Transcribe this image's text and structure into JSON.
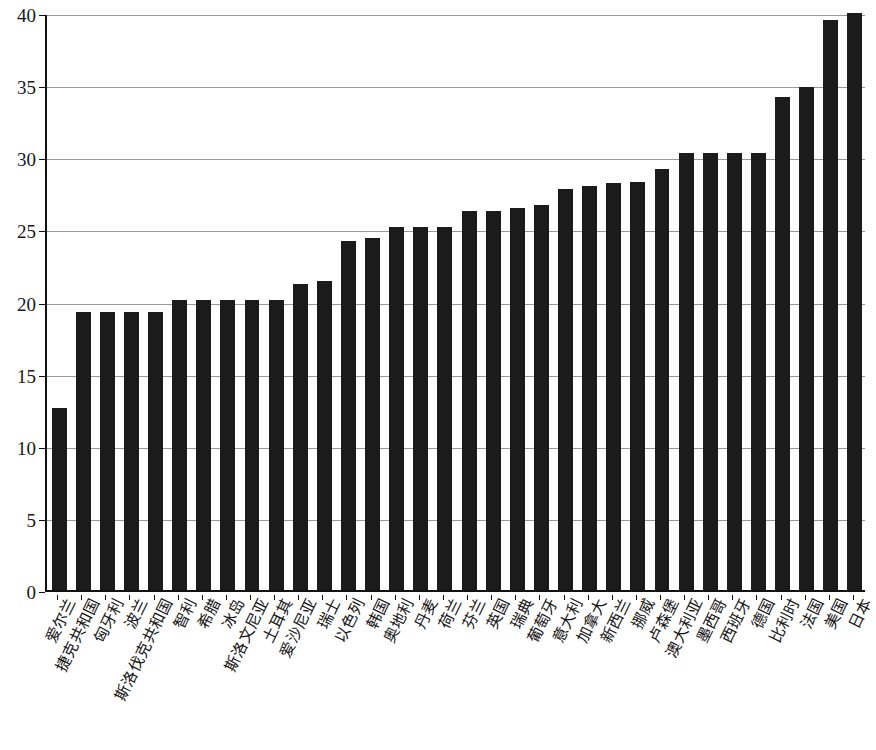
{
  "chart_data": {
    "type": "bar",
    "title": "",
    "subtitle": "",
    "xlabel": "",
    "ylabel": "",
    "ylim": [
      0,
      40
    ],
    "yticks": [
      0,
      5,
      10,
      15,
      20,
      25,
      30,
      35,
      40
    ],
    "grid": true,
    "legend": null,
    "bar_color": "#1b1b1b",
    "axis_color": "#111111",
    "grid_color": "#9a9a9a",
    "categories": [
      "爱尔兰",
      "捷克共和国",
      "匈牙利",
      "波兰",
      "斯洛伐克共和国",
      "智利",
      "希腊",
      "冰岛",
      "斯洛文尼亚",
      "土耳其",
      "爱沙尼亚",
      "瑞士",
      "以色列",
      "韩国",
      "奥地利",
      "丹麦",
      "荷兰",
      "芬兰",
      "英国",
      "瑞典",
      "葡萄牙",
      "意大利",
      "加拿大",
      "新西兰",
      "挪威",
      "卢森堡",
      "澳大利亚",
      "墨西哥",
      "西班牙",
      "德国",
      "比利时",
      "法国",
      "美国",
      "日本"
    ],
    "values": [
      12.6,
      19.3,
      19.3,
      19.3,
      19.3,
      20.1,
      20.1,
      20.1,
      20.1,
      20.1,
      21.2,
      21.4,
      24.2,
      24.4,
      25.2,
      25.2,
      25.2,
      26.3,
      26.3,
      26.5,
      26.7,
      27.8,
      28.0,
      28.2,
      28.3,
      29.2,
      30.3,
      30.3,
      30.3,
      30.3,
      34.2,
      34.9,
      39.5,
      40.0
    ]
  }
}
